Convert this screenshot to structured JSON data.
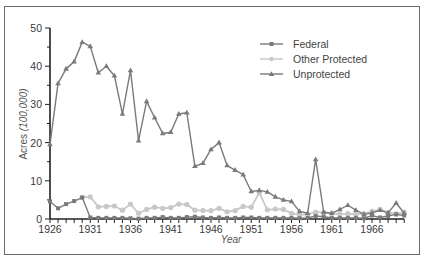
{
  "chart_data": {
    "type": "line",
    "title": "",
    "xlabel": "Year",
    "ylabel": "Acres (100,000)",
    "ylabel_main": "Acres",
    "ylabel_unit": "(100,000)",
    "xlim": [
      1926,
      1970
    ],
    "ylim": [
      0,
      50
    ],
    "x_ticks": [
      "1926",
      "1931",
      "1936",
      "1941",
      "1946",
      "1951",
      "1956",
      "1961",
      "1966"
    ],
    "y_ticks": [
      "0",
      "10",
      "20",
      "30",
      "40",
      "50"
    ],
    "grid": false,
    "legend_position": "upper right",
    "x": [
      1926,
      1927,
      1928,
      1929,
      1930,
      1931,
      1932,
      1933,
      1934,
      1935,
      1936,
      1937,
      1938,
      1939,
      1940,
      1941,
      1942,
      1943,
      1944,
      1945,
      1946,
      1947,
      1948,
      1949,
      1950,
      1951,
      1952,
      1953,
      1954,
      1955,
      1956,
      1957,
      1958,
      1959,
      1960,
      1961,
      1962,
      1963,
      1964,
      1965,
      1966,
      1967,
      1968,
      1969,
      1970
    ],
    "series": [
      {
        "name": "Federal",
        "color": "#7a7a7a",
        "marker": "square",
        "values": [
          4.6,
          2.8,
          3.9,
          4.7,
          5.6,
          0.4,
          0.3,
          0.3,
          0.3,
          0.3,
          0.2,
          0.1,
          0.3,
          0.3,
          0.5,
          0.3,
          0.3,
          0.5,
          0.6,
          0.4,
          0.3,
          0.4,
          0.3,
          0.3,
          0.4,
          0.4,
          0.3,
          0.3,
          0.3,
          0.3,
          0.3,
          0.2,
          0.3,
          0.8,
          0.6,
          0.3,
          0.3,
          0.3,
          0.3,
          0.2,
          0.9,
          0.4,
          0.8,
          1.2,
          0.9
        ]
      },
      {
        "name": "Other Protected",
        "color": "#c8c8c8",
        "marker": "circle",
        "values": [
          null,
          null,
          null,
          null,
          5.7,
          5.8,
          3.2,
          3.3,
          3.4,
          2.3,
          3.9,
          1.5,
          2.5,
          3.1,
          2.8,
          3.0,
          3.9,
          3.8,
          2.3,
          2.2,
          2.2,
          2.8,
          1.9,
          2.2,
          3.3,
          3.1,
          6.9,
          2.4,
          2.6,
          2.5,
          1.5,
          1.1,
          1.2,
          1.8,
          1.7,
          1.5,
          1.3,
          1.4,
          1.2,
          1.4,
          2.0,
          2.5,
          1.7,
          1.4,
          1.8
        ]
      },
      {
        "name": "Unprotected",
        "color": "#7a7a7a",
        "marker": "triangle",
        "values": [
          19.5,
          35.5,
          39.3,
          41.2,
          46.3,
          45.2,
          38.3,
          40.0,
          37.5,
          27.5,
          38.9,
          20.5,
          30.8,
          26.5,
          22.4,
          22.7,
          27.5,
          27.8,
          13.8,
          14.6,
          18.2,
          20.0,
          14.0,
          12.8,
          11.6,
          7.2,
          7.5,
          7.1,
          5.8,
          5.0,
          4.6,
          2.0,
          1.5,
          15.6,
          1.8,
          1.5,
          2.5,
          3.6,
          2.3,
          1.2,
          1.6,
          2.3,
          1.6,
          4.2,
          1.5
        ]
      }
    ]
  },
  "legend": {
    "items": [
      {
        "label": "Federal",
        "marker": "square-marker-icon"
      },
      {
        "label": "Other Protected",
        "marker": "circle-marker-icon"
      },
      {
        "label": "Unprotected",
        "marker": "triangle-marker-icon"
      }
    ]
  }
}
